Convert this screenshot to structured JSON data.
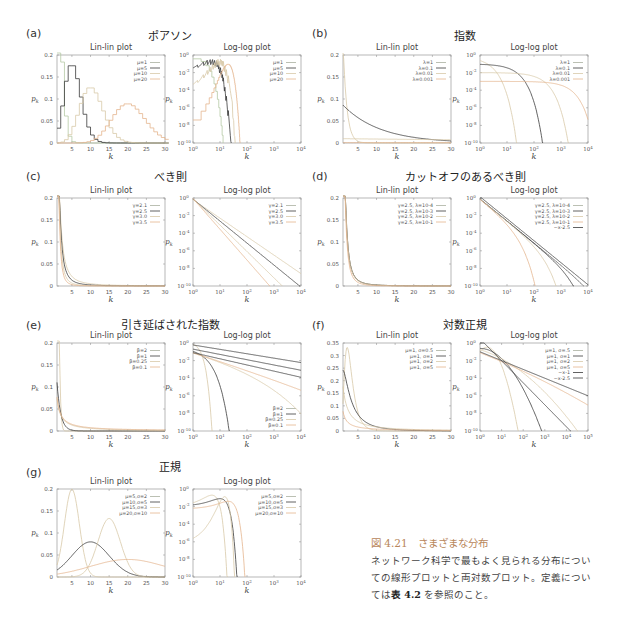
{
  "colors": {
    "black": "#3a3a3a",
    "dark": "#555555",
    "grey": "#aab0a0",
    "green": "#b5c9a4",
    "light": "#d8c9a8",
    "orange": "#e4b58e",
    "caption_accent": "#b8865a"
  },
  "caption": {
    "figure_number": "図 4.21",
    "figure_title": "さまざまな分布",
    "body_1": "ネットワーク科学で最もよく見られる分布につい",
    "body_2": "ての線形プロットと両対数プロット。定義につい",
    "body_3_pre": "ては",
    "body_3_bold": "表 4.2",
    "body_3_post": " を参照のこと。"
  },
  "panels": [
    {
      "letter": "(a)",
      "title": "ポアソン"
    },
    {
      "letter": "(b)",
      "title": "指数"
    },
    {
      "letter": "(c)",
      "title": "べき則"
    },
    {
      "letter": "(d)",
      "title": "カットオフのあるべき則"
    },
    {
      "letter": "(e)",
      "title": "引き延ばされた指数"
    },
    {
      "letter": "(f)",
      "title": "対数正規"
    },
    {
      "letter": "(g)",
      "title": "正規"
    }
  ],
  "plot_titles": {
    "lin": "Lin-lin plot",
    "log": "Log-log plot"
  },
  "chart_data": [
    {
      "panel": "a",
      "name": "Poisson",
      "type": "line",
      "subplots": [
        {
          "title": "Lin-lin plot",
          "xlabel": "k",
          "ylabel": "p_k",
          "xlim": [
            1,
            30
          ],
          "ylim": [
            0,
            0.2
          ],
          "xticks": [
            5,
            10,
            15,
            20,
            25,
            30
          ],
          "yticks": [
            0,
            0.05,
            0.1,
            0.15,
            0.2
          ],
          "legend": [
            "μ=1",
            "μ=5",
            "μ=10",
            "μ=20"
          ],
          "peaks": [
            {
              "series": "μ=1",
              "k": 1,
              "p": 0.37
            },
            {
              "series": "μ=5",
              "k": 4.5,
              "p": 0.175
            },
            {
              "series": "μ=10",
              "k": 9.5,
              "p": 0.125
            },
            {
              "series": "μ=20",
              "k": 19.5,
              "p": 0.089
            }
          ]
        },
        {
          "title": "Log-log plot",
          "xlabel": "k",
          "ylabel": "p_k",
          "xlim": [
            "10^0",
            "10^4"
          ],
          "ylim": [
            "10^-10",
            "10^0"
          ],
          "xticks": [
            "10^0",
            "10^1",
            "10^2",
            "10^3",
            "10^4"
          ],
          "yticks": [
            "10^-10",
            "10^-8",
            "10^-6",
            "10^-4",
            "10^-2",
            "10^0"
          ],
          "legend": [
            "μ=1",
            "μ=5",
            "μ=10",
            "μ=20"
          ]
        }
      ]
    },
    {
      "panel": "b",
      "name": "Exponential",
      "type": "line",
      "subplots": [
        {
          "title": "Lin-lin plot",
          "xlabel": "k",
          "ylabel": "p_k",
          "xlim": [
            1,
            30
          ],
          "ylim": [
            0,
            0.2
          ],
          "xticks": [
            5,
            10,
            15,
            20,
            25,
            30
          ],
          "yticks": [
            0,
            0.05,
            0.1,
            0.15,
            0.2
          ],
          "legend": [
            "λ=1",
            "λ=0.1",
            "λ=0.01",
            "λ=0.001"
          ]
        },
        {
          "title": "Log-log plot",
          "xlabel": "k",
          "ylabel": "p_k",
          "xticks": [
            "10^0",
            "10^1",
            "10^2",
            "10^3",
            "10^4"
          ],
          "yticks": [
            "10^-10",
            "10^-8",
            "10^-6",
            "10^-4",
            "10^-2",
            "10^0"
          ],
          "legend": [
            "λ=1",
            "λ=0.1",
            "λ=0.01",
            "λ=0.001"
          ]
        }
      ]
    },
    {
      "panel": "c",
      "name": "Power law",
      "type": "line",
      "subplots": [
        {
          "title": "Lin-lin plot",
          "xlabel": "k",
          "ylabel": "p_k",
          "xlim": [
            1,
            30
          ],
          "ylim": [
            0,
            0.2
          ],
          "xticks": [
            5,
            10,
            15,
            20,
            25,
            30
          ],
          "yticks": [
            0,
            0.05,
            0.1,
            0.15,
            0.2
          ],
          "legend": [
            "γ=2.1",
            "γ=2.5",
            "γ=3.0",
            "γ=3.5"
          ]
        },
        {
          "title": "Log-log plot",
          "xlabel": "k",
          "ylabel": "p_k",
          "xticks": [
            "10^0",
            "10^1",
            "10^2",
            "10^3",
            "10^4"
          ],
          "yticks": [
            "10^-10",
            "10^-8",
            "10^-6",
            "10^-4",
            "10^-2",
            "10^0"
          ],
          "legend": [
            "γ=2.1",
            "γ=2.5",
            "γ=3.0",
            "γ=3.5"
          ]
        }
      ]
    },
    {
      "panel": "d",
      "name": "Power law with cutoff",
      "type": "line",
      "subplots": [
        {
          "title": "Lin-lin plot",
          "xlabel": "k",
          "ylabel": "p_k",
          "xlim": [
            1,
            30
          ],
          "ylim": [
            0,
            0.2
          ],
          "xticks": [
            5,
            10,
            15,
            20,
            25,
            30
          ],
          "yticks": [
            0,
            0.05,
            0.1,
            0.15,
            0.2
          ],
          "legend": [
            "γ=2.5, λ=10^-4",
            "γ=2.5, λ=10^-3",
            "γ=2.5, λ=10^-2",
            "γ=2.5, λ=10^-1"
          ]
        },
        {
          "title": "Log-log plot",
          "xlabel": "k",
          "ylabel": "p_k",
          "xticks": [
            "10^0",
            "10^1",
            "10^2",
            "10^3",
            "10^4"
          ],
          "yticks": [
            "10^-10",
            "10^-8",
            "10^-6",
            "10^-4",
            "10^-2",
            "10^0"
          ],
          "legend": [
            "γ=2.5, λ=10^-4",
            "γ=2.5, λ=10^-3",
            "γ=2.5, λ=10^-2",
            "γ=2.5, λ=10^-1",
            "~x^-2.5"
          ]
        }
      ]
    },
    {
      "panel": "e",
      "name": "Stretched exponential",
      "type": "line",
      "subplots": [
        {
          "title": "Lin-lin plot",
          "xlabel": "k",
          "ylabel": "p_k",
          "xlim": [
            1,
            30
          ],
          "ylim": [
            0,
            0.2
          ],
          "xticks": [
            5,
            10,
            15,
            20,
            25,
            30
          ],
          "yticks": [
            0,
            0.05,
            0.1,
            0.15,
            0.2
          ],
          "legend": [
            "β=2",
            "β=1",
            "β=0.25",
            "β=0.1"
          ]
        },
        {
          "title": "Log-log plot",
          "xlabel": "k",
          "ylabel": "p_k",
          "xticks": [
            "10^0",
            "10^1",
            "10^2",
            "10^3",
            "10^4"
          ],
          "yticks": [
            "10^-10",
            "10^-8",
            "10^-6",
            "10^-4",
            "10^-2",
            "10^0"
          ],
          "legend": [
            "β=2",
            "β=1",
            "β=0.25",
            "β=0.1"
          ],
          "legend_position": "lower right"
        }
      ]
    },
    {
      "panel": "f",
      "name": "Log-normal",
      "type": "line",
      "subplots": [
        {
          "title": "Lin-lin plot",
          "xlabel": "k",
          "ylabel": "p_k",
          "xlim": [
            1,
            30
          ],
          "ylim": [
            0,
            0.35
          ],
          "xticks": [
            5,
            10,
            15,
            20,
            25,
            30
          ],
          "yticks": [
            0,
            0.05,
            0.1,
            0.15,
            0.2,
            0.25,
            0.3,
            0.35
          ],
          "legend": [
            "μ=1, σ=0.5",
            "μ=1, σ=1",
            "μ=1, σ=2",
            "μ=1, σ=5"
          ]
        },
        {
          "title": "Log-log plot",
          "xlabel": "k",
          "ylabel": "p_k",
          "xticks": [
            "10^0",
            "10^1",
            "10^2",
            "10^3",
            "10^4",
            "10^5"
          ],
          "yticks": [
            "10^-10",
            "10^-8",
            "10^-6",
            "10^-4",
            "10^-2",
            "10^0"
          ],
          "legend": [
            "μ=1, σ=.5",
            "μ=1, σ=1",
            "μ=1, σ=2",
            "μ=1, σ=5",
            "~x^-1",
            "~x^-2.5"
          ]
        }
      ]
    },
    {
      "panel": "g",
      "name": "Normal",
      "type": "line",
      "subplots": [
        {
          "title": "Lin-lin plot",
          "xlabel": "k",
          "ylabel": "p_k",
          "xlim": [
            1,
            30
          ],
          "ylim": [
            0,
            0.2
          ],
          "xticks": [
            5,
            10,
            15,
            20,
            25,
            30
          ],
          "yticks": [
            0,
            0.05,
            0.1,
            0.15,
            0.2
          ],
          "legend": [
            "μ=5,σ=2",
            "μ=10,σ=5",
            "μ=15,σ=3",
            "μ=20,σ=10"
          ],
          "peaks": [
            {
              "series": "μ=5,σ=2",
              "k": 5,
              "p": 0.2
            },
            {
              "series": "μ=10,σ=5",
              "k": 10,
              "p": 0.08
            },
            {
              "series": "μ=15,σ=3",
              "k": 15,
              "p": 0.133
            },
            {
              "series": "μ=20,σ=10",
              "k": 20,
              "p": 0.04
            }
          ]
        },
        {
          "title": "Log-log plot",
          "xlabel": "k",
          "ylabel": "p_k",
          "xticks": [
            "10^0",
            "10^1",
            "10^2",
            "10^3",
            "10^4"
          ],
          "yticks": [
            "10^-10",
            "10^-8",
            "10^-6",
            "10^-4",
            "10^-2",
            "10^0"
          ],
          "legend": [
            "μ=5,σ=2",
            "μ=10,σ=5",
            "μ=15,σ=3",
            "μ=20,σ=10"
          ]
        }
      ]
    }
  ]
}
